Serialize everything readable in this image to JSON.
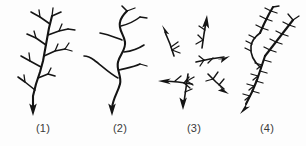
{
  "figure": {
    "background_color": "#fdfdfd",
    "ink_color": "#141414",
    "label_color": "#3a3a3a",
    "panel_count": 4
  },
  "panels": [
    {
      "id": "panel-1",
      "label": "(1)",
      "pattern_name": "dense-monopodial-branching",
      "flow_arrow_direction": "down",
      "x": 0,
      "width": 86
    },
    {
      "id": "panel-2",
      "label": "(2)",
      "pattern_name": "sinuous-sparse-branching",
      "flow_arrow_direction": "down",
      "x": 80,
      "width": 80
    },
    {
      "id": "panel-3",
      "label": "(3)",
      "pattern_name": "scattered-radiating-fragments",
      "flow_arrow_direction": "radial",
      "fragment_count": 6,
      "fragment_directions": [
        "up-left",
        "up",
        "right",
        "left",
        "down-right",
        "down"
      ],
      "x": 156,
      "width": 76
    },
    {
      "id": "panel-4",
      "label": "(4)",
      "pattern_name": "feather-like-pinnate-branching",
      "flow_arrow_direction": "down-left",
      "x": 228,
      "width": 78
    }
  ]
}
